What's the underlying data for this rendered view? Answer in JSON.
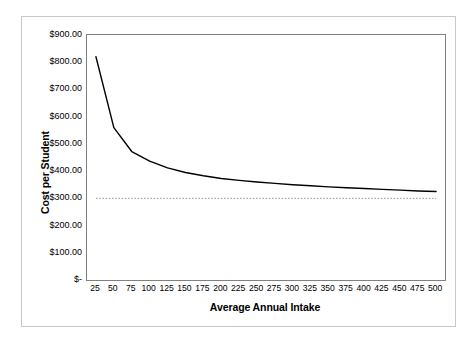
{
  "chart_data": {
    "type": "line",
    "title": "",
    "xlabel": "Average Annual Intake",
    "ylabel": "Cost per Student",
    "categories": [
      25,
      50,
      75,
      100,
      125,
      150,
      175,
      200,
      225,
      250,
      275,
      300,
      325,
      350,
      375,
      400,
      425,
      450,
      475,
      500
    ],
    "x_tick_labels": [
      "25",
      "50",
      "75",
      "100",
      "125",
      "150",
      "175",
      "200",
      "225",
      "250",
      "275",
      "300",
      "325",
      "350",
      "375",
      "400",
      "425",
      "450",
      "475",
      "500"
    ],
    "y_tick_labels": [
      "$900.00",
      "$800.00",
      "$700.00",
      "$600.00",
      "$500.00",
      "$400.00",
      "$300.00",
      "$200.00",
      "$100.00",
      "$-"
    ],
    "y_tick_values": [
      900,
      800,
      700,
      600,
      500,
      400,
      300,
      200,
      100,
      0
    ],
    "ylim": [
      0,
      900
    ],
    "grid": false,
    "legend": "none",
    "series": [
      {
        "name": "Cost per Student",
        "style": "solid",
        "color": "#000000",
        "values": [
          820,
          560,
          472,
          437,
          412,
          395,
          383,
          373,
          366,
          360,
          355,
          350,
          346,
          342,
          339,
          336,
          333,
          330,
          327,
          325
        ]
      },
      {
        "name": "Reference level",
        "style": "dotted",
        "color": "#999999",
        "constant_value": 300,
        "values": [
          300,
          300,
          300,
          300,
          300,
          300,
          300,
          300,
          300,
          300,
          300,
          300,
          300,
          300,
          300,
          300,
          300,
          300,
          300,
          300
        ]
      }
    ]
  }
}
